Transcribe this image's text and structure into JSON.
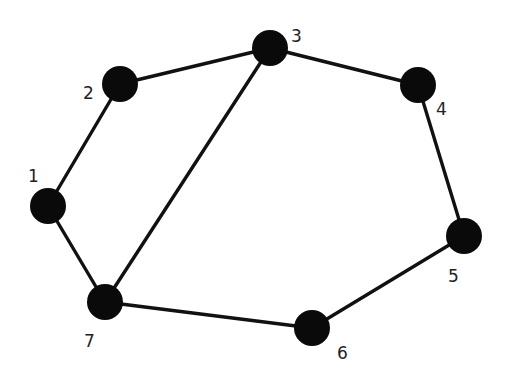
{
  "graph": {
    "title": "",
    "node_color": "#0a0a0a",
    "edge_color": "#111111",
    "node_radius": 18,
    "nodes": [
      {
        "id": "1",
        "label": "1",
        "x": 48,
        "y": 206,
        "lx": 28,
        "ly": 182
      },
      {
        "id": "2",
        "label": "2",
        "x": 120,
        "y": 84,
        "lx": 83,
        "ly": 99
      },
      {
        "id": "3",
        "label": "3",
        "x": 270,
        "y": 48,
        "lx": 291,
        "ly": 42
      },
      {
        "id": "4",
        "label": "4",
        "x": 418,
        "y": 85,
        "lx": 436,
        "ly": 115
      },
      {
        "id": "5",
        "label": "5",
        "x": 464,
        "y": 236,
        "lx": 448,
        "ly": 282
      },
      {
        "id": "6",
        "label": "6",
        "x": 312,
        "y": 328,
        "lx": 337,
        "ly": 359
      },
      {
        "id": "7",
        "label": "7",
        "x": 105,
        "y": 302,
        "lx": 84,
        "ly": 347
      }
    ],
    "edges": [
      {
        "from": "1",
        "to": "2"
      },
      {
        "from": "2",
        "to": "3"
      },
      {
        "from": "3",
        "to": "4"
      },
      {
        "from": "4",
        "to": "5"
      },
      {
        "from": "5",
        "to": "6"
      },
      {
        "from": "6",
        "to": "7"
      },
      {
        "from": "7",
        "to": "1"
      },
      {
        "from": "3",
        "to": "7"
      }
    ]
  }
}
